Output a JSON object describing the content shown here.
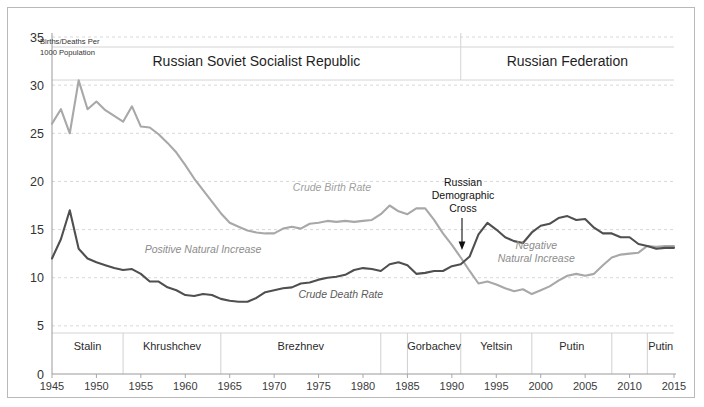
{
  "figure": {
    "corner_note_line1": "Births/Deaths Per",
    "corner_note_line2": "1000 Population",
    "banner_left": "Russian Soviet Socialist Republic",
    "banner_right": "Russian Federation",
    "banner_split_year": 1991
  },
  "annotations": {
    "birth_label": "Crude Birth Rate",
    "death_label": "Crude Death Rate",
    "positive_gap": "Positive Natural Increase",
    "negative_gap_line1": "Negative",
    "negative_gap_line2": "Natural Increase",
    "cross_line1": "Russian",
    "cross_line2": "Demographic",
    "cross_line3": "Cross"
  },
  "colors": {
    "birth": "#a8a8a8",
    "death": "#4f4f4f",
    "grid": "#d8d8d8",
    "axis": "#9a9a9a",
    "frame": "#b9b9b9",
    "text": "#2b2b2b"
  },
  "eras": [
    {
      "name": "Stalin",
      "start": 1945,
      "end": 1953
    },
    {
      "name": "Khrushchev",
      "start": 1953,
      "end": 1964
    },
    {
      "name": "Brezhnev",
      "start": 1964,
      "end": 1982
    },
    {
      "name": "Gorbachev",
      "start": 1985,
      "end": 1991
    },
    {
      "name": "Yeltsin",
      "start": 1991,
      "end": 1999
    },
    {
      "name": "Putin",
      "start": 1999,
      "end": 2008
    },
    {
      "name": "Putin",
      "start": 2012,
      "end": 2015
    }
  ],
  "era_boundaries": [
    1953,
    1964,
    1982,
    1985,
    1991,
    1999,
    2008,
    2012
  ],
  "chart_data": {
    "type": "line",
    "title": "",
    "xlabel": "",
    "ylabel": "Births/Deaths Per 1000 Population",
    "xlim": [
      1945,
      2015
    ],
    "ylim": [
      0,
      35
    ],
    "yticks": [
      0,
      5,
      10,
      15,
      20,
      25,
      30,
      35
    ],
    "xticks": [
      1945,
      1950,
      1955,
      1960,
      1965,
      1970,
      1975,
      1980,
      1985,
      1990,
      1995,
      2000,
      2005,
      2010,
      2015
    ],
    "grid": true,
    "legend": "inline-labels",
    "x": [
      1945,
      1946,
      1947,
      1948,
      1949,
      1950,
      1951,
      1952,
      1953,
      1954,
      1955,
      1956,
      1957,
      1958,
      1959,
      1960,
      1961,
      1962,
      1963,
      1964,
      1965,
      1966,
      1967,
      1968,
      1969,
      1970,
      1971,
      1972,
      1973,
      1974,
      1975,
      1976,
      1977,
      1978,
      1979,
      1980,
      1981,
      1982,
      1983,
      1984,
      1985,
      1986,
      1987,
      1988,
      1989,
      1990,
      1991,
      1992,
      1993,
      1994,
      1995,
      1996,
      1997,
      1998,
      1999,
      2000,
      2001,
      2002,
      2003,
      2004,
      2005,
      2006,
      2007,
      2008,
      2009,
      2010,
      2011,
      2012,
      2013,
      2014,
      2015
    ],
    "series": [
      {
        "name": "Crude Birth Rate",
        "color": "#a8a8a8",
        "values": [
          26.0,
          27.5,
          25.0,
          30.5,
          27.5,
          28.3,
          27.4,
          26.8,
          26.2,
          27.8,
          25.7,
          25.6,
          24.9,
          24.0,
          23.0,
          21.7,
          20.3,
          19.1,
          17.9,
          16.7,
          15.7,
          15.3,
          14.9,
          14.7,
          14.6,
          14.6,
          15.1,
          15.3,
          15.1,
          15.6,
          15.7,
          15.9,
          15.8,
          15.9,
          15.8,
          15.9,
          16.0,
          16.6,
          17.5,
          16.9,
          16.6,
          17.2,
          17.2,
          16.0,
          14.6,
          13.4,
          12.1,
          10.7,
          9.4,
          9.6,
          9.3,
          8.9,
          8.6,
          8.8,
          8.3,
          8.7,
          9.1,
          9.7,
          10.2,
          10.4,
          10.2,
          10.4,
          11.3,
          12.1,
          12.4,
          12.5,
          12.6,
          13.3,
          13.2,
          13.3,
          13.3
        ]
      },
      {
        "name": "Crude Death Rate",
        "color": "#4f4f4f",
        "values": [
          12.0,
          14.0,
          17.0,
          13.0,
          12.0,
          11.6,
          11.3,
          11.0,
          10.8,
          10.9,
          10.4,
          9.6,
          9.6,
          9.0,
          8.7,
          8.2,
          8.1,
          8.3,
          8.2,
          7.8,
          7.6,
          7.5,
          7.5,
          7.9,
          8.5,
          8.7,
          8.9,
          9.0,
          9.4,
          9.5,
          9.8,
          10.0,
          10.1,
          10.3,
          10.8,
          11.0,
          10.9,
          10.7,
          11.4,
          11.6,
          11.3,
          10.4,
          10.5,
          10.7,
          10.7,
          11.2,
          11.4,
          12.2,
          14.5,
          15.7,
          15.0,
          14.2,
          13.8,
          13.6,
          14.7,
          15.4,
          15.6,
          16.2,
          16.4,
          16.0,
          16.1,
          15.2,
          14.6,
          14.6,
          14.2,
          14.2,
          13.5,
          13.3,
          13.0,
          13.1,
          13.1
        ]
      }
    ],
    "cross_point": {
      "year": 1992,
      "value": 11.4,
      "label": "Russian Demographic Cross"
    }
  }
}
